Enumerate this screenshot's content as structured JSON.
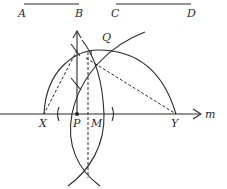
{
  "segments": {
    "AB": {
      "start_label": "A",
      "end_label": "B"
    },
    "CD": {
      "start_label": "C",
      "end_label": "D"
    }
  },
  "line": {
    "label": "m"
  },
  "points": {
    "X": "X",
    "P": "P",
    "M": "M",
    "Y": "Y",
    "Q": "Q"
  },
  "colors": {
    "stroke": "#2a2a2a",
    "background": "#ffffff"
  }
}
